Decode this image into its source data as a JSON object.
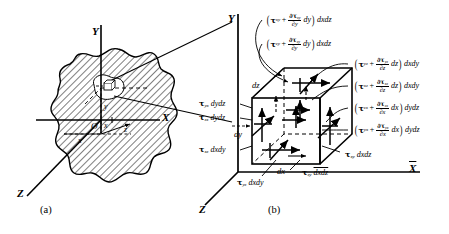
{
  "figure": {
    "panel_a": {
      "caption": "(a)",
      "axes": {
        "x_axis": "X",
        "y_axis": "Y",
        "z_axis": "Z"
      },
      "element_coords": {
        "x": "x",
        "y": "y",
        "z": "z",
        "origin": "O",
        "x2": "x"
      },
      "description": "irregular hatched solid body with coordinate axes and an infinitesimal element extracted at a point"
    },
    "panel_b": {
      "caption": "(b)",
      "axes": {
        "x_axis": "X",
        "y_axis": "Y",
        "z_axis": "Z"
      },
      "dimensions": {
        "dx": "dx",
        "dy": "dy",
        "dz": "dz"
      },
      "top_labels": [
        {
          "id": "tau-xy-top",
          "tau": "τ",
          "sub": "xy",
          "op": "+",
          "dnum": "∂τ",
          "dnum_sub": "xy",
          "dden": "∂y",
          "diff": "dy",
          "area": "dxdz"
        },
        {
          "id": "tau-zy-top",
          "tau": "τ",
          "sub": "zy",
          "op": "+",
          "dnum": "∂τ",
          "dnum_sub": "zy",
          "dden": "∂y",
          "diff": "dy",
          "area": "dxdz"
        }
      ],
      "right_labels": [
        {
          "id": "tau-yz-front",
          "tau": "τ",
          "sub": "yz",
          "op": "+",
          "dnum": "∂τ",
          "dnum_sub": "yz",
          "dden": "∂z",
          "diff": "dz",
          "area": "dxdy"
        },
        {
          "id": "tau-xz-front",
          "tau": "τ",
          "sub": "xz",
          "op": "+",
          "dnum": "∂τ",
          "dnum_sub": "xz",
          "dden": "∂z",
          "diff": "dz",
          "area": "dxdy"
        },
        {
          "id": "tau-zx-right",
          "tau": "τ",
          "sub": "zx",
          "op": "+",
          "dnum": "∂τ",
          "dnum_sub": "zx",
          "dden": "∂x",
          "diff": "dx",
          "area": "dydz"
        },
        {
          "id": "tau-yx-right",
          "tau": "τ",
          "sub": "yx",
          "op": "+",
          "dnum": "∂τ",
          "dnum_sub": "yx",
          "dden": "∂x",
          "diff": "dx",
          "area": "dydz"
        }
      ],
      "left_labels": [
        {
          "id": "tau-yx-left",
          "tau": "τ",
          "sub": "yx",
          "area": "dydz"
        },
        {
          "id": "tau-zx-left",
          "tau": "τ",
          "sub": "zx",
          "area": "dydz"
        },
        {
          "id": "tau-xz-back",
          "tau": "τ",
          "sub": "xz",
          "area": "dxdy"
        }
      ],
      "bottom_labels": [
        {
          "id": "tau-yz-bottom",
          "tau": "τ",
          "sub": "yz",
          "area": "dxdy"
        },
        {
          "id": "tau-zy-bottom",
          "tau": "τ",
          "sub": "zy",
          "area": "dxdz"
        },
        {
          "id": "tau-xy-bottom",
          "tau": "τ",
          "sub": "xy",
          "area": "dxdz"
        }
      ]
    }
  }
}
